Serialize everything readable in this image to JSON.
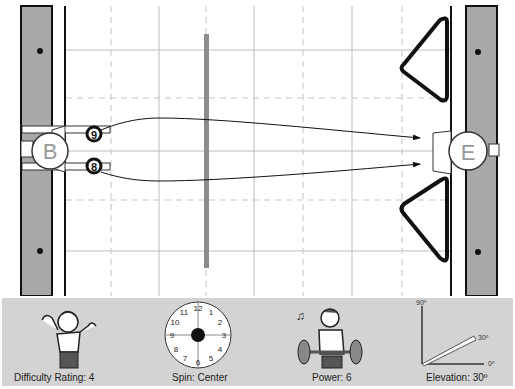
{
  "field": {
    "start_marker": "B",
    "end_marker": "E",
    "balls": [
      {
        "number": "9",
        "position": "upper"
      },
      {
        "number": "8",
        "position": "lower"
      }
    ],
    "obstacles": [
      "center-bar",
      "upper-triangle",
      "lower-triangle"
    ],
    "colors": {
      "rail": "#a8a8a8",
      "bar": "#8c8c8c",
      "grid": "#bdbdbd",
      "outline": "#111111"
    }
  },
  "panel": {
    "difficulty": {
      "label": "Difficulty Rating: 4",
      "value": 4,
      "icon": "shrugging-person-icon"
    },
    "spin": {
      "label": "Spin: Center",
      "value": "Center",
      "icon": "clock-dial-icon",
      "dial_numbers": [
        "12",
        "1",
        "2",
        "3",
        "4",
        "5",
        "6",
        "7",
        "8",
        "9",
        "10",
        "11"
      ]
    },
    "power": {
      "label": "Power: 6",
      "value": 6,
      "icon": "weightlifter-icon"
    },
    "elevation": {
      "label": "Elevation: 30º",
      "value": 30,
      "axis_labels": {
        "top": "90º",
        "angle": "30º",
        "zero": "0º"
      }
    }
  }
}
